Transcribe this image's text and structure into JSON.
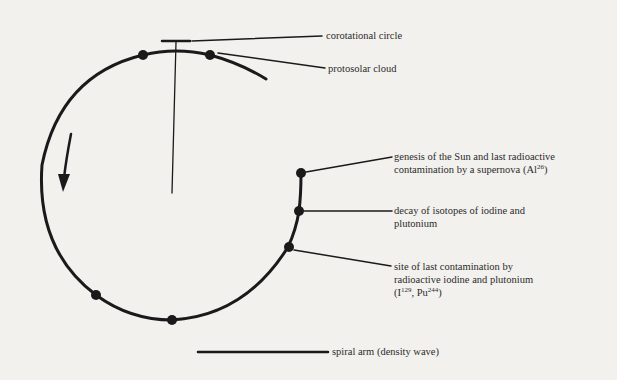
{
  "diagram": {
    "title": "",
    "background_color": "#f2f1ee",
    "stroke_color": "#1a1a1a",
    "labels": {
      "corotational_circle": "corotational circle",
      "protosolar_cloud": "protosolar cloud",
      "genesis_line1": "genesis of the Sun and last radioactive",
      "genesis_line2_pre": "contamination by a supernova (Al",
      "genesis_line2_sup": "26",
      "genesis_line2_post": ")",
      "decay_line1": "decay of isotopes of iodine and",
      "decay_line2": "plutonium",
      "site_line1": "site of last contamination by",
      "site_line2": "radioactive iodine and plutonium",
      "site_line3_a": "(I",
      "site_line3_sup1": "129",
      "site_line3_b": ", Pu",
      "site_line3_sup2": "244",
      "site_line3_c": ")"
    },
    "legend": {
      "spiral_arm": "spiral arm (density wave)"
    },
    "nodes": [
      {
        "id": "top-left",
        "x": 143,
        "y": 55
      },
      {
        "id": "protosolar-cloud",
        "x": 210,
        "y": 55
      },
      {
        "id": "genesis",
        "x": 301,
        "y": 173
      },
      {
        "id": "decay",
        "x": 299,
        "y": 211
      },
      {
        "id": "site-contamination",
        "x": 288,
        "y": 247
      },
      {
        "id": "bottom",
        "x": 172,
        "y": 320
      },
      {
        "id": "lower-left",
        "x": 96,
        "y": 295
      }
    ],
    "rotation_direction": "counterclockwise (arrow pointing down on left side)"
  }
}
